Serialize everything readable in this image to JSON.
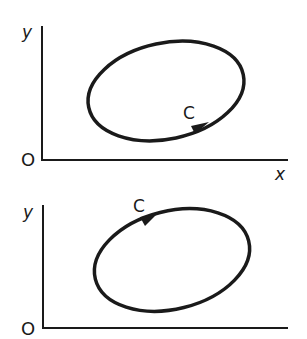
{
  "diagrams": [
    {
      "id": "top",
      "axes": {
        "y_label": "y",
        "x_label": "x",
        "origin_label": "O"
      },
      "curve": {
        "label": "C",
        "direction": "counterclockwise",
        "arrow_position": "bottom-right"
      }
    },
    {
      "id": "bottom",
      "axes": {
        "y_label": "y",
        "origin_label": "O"
      },
      "curve": {
        "label": "C",
        "direction": "clockwise",
        "arrow_position": "top-left"
      }
    }
  ],
  "colors": {
    "stroke": "#1a1a1a",
    "background": "#ffffff"
  }
}
